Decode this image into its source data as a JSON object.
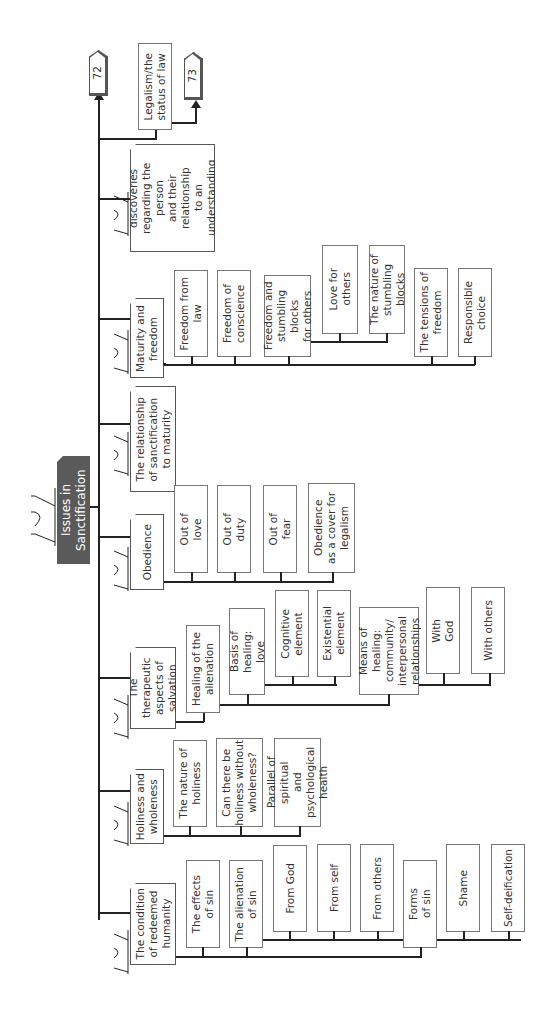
{
  "title": "Issues in Sanctification",
  "continuations": {
    "a": "72",
    "b": "73"
  },
  "branches": [
    {
      "label": "The condition\nof redeemed\nhumanity",
      "children": [
        {
          "label": "The effects\nof sin"
        },
        {
          "label": "The alienation\nof sin",
          "children": [
            {
              "label": "From God"
            },
            {
              "label": "From self"
            },
            {
              "label": "From others"
            }
          ]
        },
        {
          "label": "Forms\nof sin",
          "children": [
            {
              "label": "Shame"
            },
            {
              "label": "Self-deification"
            }
          ]
        }
      ]
    },
    {
      "label": "Holiness and\nwholeness",
      "children": [
        {
          "label": "The nature of\nholiness"
        },
        {
          "label": "Can there be\nholiness without\nwholeness?"
        },
        {
          "label": "Parallel of spiritual\nand psychological\nhealth"
        }
      ]
    },
    {
      "label": "The therapeutic\naspects of\nsalvation",
      "children": [
        {
          "label": "Healing of the\nalienation",
          "children": [
            {
              "label": "Basis of healing:\nlove",
              "children": [
                {
                  "label": "Cognitive\nelement"
                },
                {
                  "label": "Existential\nelement"
                }
              ]
            },
            {
              "label": "Means of healing:\ncommunity/\ninterpersonal\nrelationships",
              "children": [
                {
                  "label": "With\nGod"
                },
                {
                  "label": "With others"
                }
              ]
            }
          ]
        }
      ]
    },
    {
      "label": "Obedience",
      "children": [
        {
          "label": "Out of\nlove"
        },
        {
          "label": "Out of\nduty"
        },
        {
          "label": "Out of\nfear"
        },
        {
          "label": "Obedience\nas a cover for\nlegalism"
        }
      ]
    },
    {
      "label": "The relationship\nof sanctification\nto maturity"
    },
    {
      "label": "Maturity and\nfreedom",
      "children": [
        {
          "label": "Freedom from\nlaw"
        },
        {
          "label": "Freedom of\nconscience"
        },
        {
          "label": "Freedom and\nstumbling blocks\nfor others",
          "children": [
            {
              "label": "Love for\nothers"
            },
            {
              "label": "The nature of\nstumbling blocks"
            }
          ]
        },
        {
          "label": "The tensions of\nfreedom"
        },
        {
          "label": "Responsible\nchoice"
        }
      ]
    },
    {
      "label": "Psychological discoveries\nregarding the person\nand their relationship\nto an understanding\nof sanctification"
    },
    {
      "label": "Legalism/the\nstatus of law"
    }
  ]
}
